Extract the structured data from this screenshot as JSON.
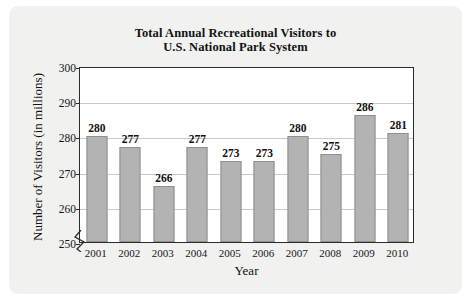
{
  "chart_data": {
    "type": "bar",
    "title": "Total Annual Recreational Visitors to U.S. National Park System",
    "title_lines": [
      "Total Annual Recreational Visitors to",
      "U.S. National Park System"
    ],
    "xlabel": "Year",
    "ylabel": "Number of Visitors (in millions)",
    "categories": [
      "2001",
      "2002",
      "2003",
      "2004",
      "2005",
      "2006",
      "2007",
      "2008",
      "2009",
      "2010"
    ],
    "values": [
      280,
      277,
      266,
      277,
      273,
      273,
      280,
      275,
      286,
      281
    ],
    "ylim": [
      250,
      300
    ],
    "y_ticks": [
      250,
      260,
      270,
      280,
      290,
      300
    ],
    "y_tick_labels": [
      "250",
      "260",
      "270",
      "280",
      "290",
      "300"
    ],
    "axis_break": true,
    "axis_break_note": "y-axis broken below 250",
    "grid": true,
    "grid_orientation": "horizontal",
    "legend": false,
    "bar_fill_color": "#b3b3b3",
    "bar_border_color": "#8f8f8f",
    "plot_background": "#ffffff",
    "page_background": "#f1f1f0",
    "axis_color": "#2b2b2b",
    "gridline_color": "#c9c9c9",
    "data_labels": [
      "280",
      "277",
      "266",
      "277",
      "273",
      "273",
      "280",
      "275",
      "286",
      "281"
    ],
    "value_label_position": "above-bar"
  }
}
